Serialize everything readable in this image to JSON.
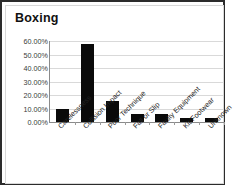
{
  "chart_data": {
    "type": "bar",
    "title": "Boxing",
    "xlabel": "",
    "ylabel": "",
    "grid": true,
    "legend": false,
    "ylim": [
      0,
      60
    ],
    "ytick_labels": [
      "60.00%",
      "50.00%",
      "40.00%",
      "30.00%",
      "20.00%",
      "10.00%",
      "0.00%"
    ],
    "ytick_values": [
      60,
      50,
      40,
      30,
      20,
      10,
      0
    ],
    "categories": [
      "Carelessness",
      "Collision Impact",
      "Poor Technique",
      "Fall or Slip",
      "Faulty Equipment",
      "Kit/Footwear",
      "Unknown"
    ],
    "values": [
      9.5,
      57.5,
      15.5,
      5.8,
      6.0,
      3.0,
      3.2
    ],
    "value_labels": [
      "9.50%",
      "57.50%",
      "15.50%",
      "5.80%",
      "6.00%",
      "3.00%",
      "3.20%"
    ],
    "bar_color": "#0a0a0a",
    "grid_color": "#d9d9d9",
    "axis_color": "#8a8a8a",
    "background_color": "#ffffff",
    "border_color": "#2b2b2b"
  }
}
